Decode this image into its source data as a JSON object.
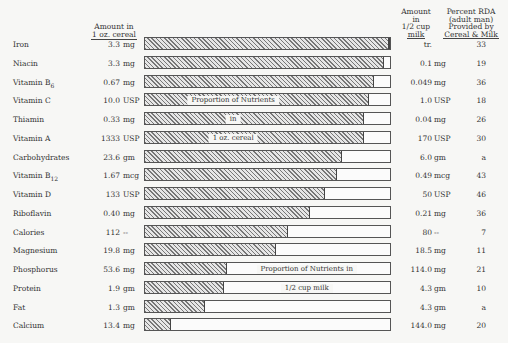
{
  "chart_data": {
    "type": "bar",
    "orientation": "horizontal-stacked-proportion",
    "title": "",
    "columns": {
      "cereal_amount": "Amount in 1 oz. cereal",
      "milk_amount": "Amount in 1/2 cup milk",
      "rda": "Percent RDA (adult man) Provided by Cereal & Milk"
    },
    "bar_annotations": {
      "cereal": [
        "Proportion of Nutrients",
        "in",
        "1 oz. cereal"
      ],
      "milk": [
        "Proportion of Nutrients in",
        "1/2 cup milk"
      ]
    },
    "categories": [
      "Iron",
      "Niacin",
      "Vitamin B6",
      "Vitamin C",
      "Thiamin",
      "Vitamin A",
      "Carbohydrates",
      "Vitamin B12",
      "Vitamin D",
      "Riboflavin",
      "Calories",
      "Magnesium",
      "Phosphorus",
      "Protein",
      "Fat",
      "Calcium"
    ],
    "series": [
      {
        "name": "Proportion from 1 oz. cereal (%)",
        "values": [
          99,
          97,
          93,
          91,
          89,
          89,
          80,
          78,
          73,
          67,
          58,
          53,
          33,
          32,
          24,
          10
        ]
      },
      {
        "name": "Proportion from 1/2 cup milk (%)",
        "values": [
          1,
          3,
          7,
          9,
          11,
          11,
          20,
          22,
          27,
          33,
          42,
          47,
          67,
          68,
          76,
          90
        ]
      }
    ],
    "xlim": [
      0,
      100
    ],
    "legend": "none"
  },
  "headers": {
    "cereal_amount_line1": "Amount in",
    "cereal_amount_line2": "1 oz. cereal",
    "milk_amount_line1": "Amount",
    "milk_amount_line2": "in",
    "milk_amount_line3": "1/2 cup",
    "milk_amount_line4": "milk",
    "rda_line1": "Percent RDA",
    "rda_line2": "(adult man)",
    "rda_line3": "Provided by",
    "rda_line4": "Cereal & Milk"
  },
  "rows": [
    {
      "name": "Iron",
      "sub": "",
      "cereal_amt": "3.3",
      "cereal_unit": "mg",
      "pct": 99,
      "milk_amt": "tr.",
      "milk_unit": "",
      "rda": "33",
      "label": ""
    },
    {
      "name": "Niacin",
      "sub": "",
      "cereal_amt": "3.3",
      "cereal_unit": "mg",
      "pct": 97,
      "milk_amt": "0.1",
      "milk_unit": "mg",
      "rda": "19",
      "label": ""
    },
    {
      "name": "Vitamin B",
      "sub": "6",
      "cereal_amt": "0.67",
      "cereal_unit": "mg",
      "pct": 93,
      "milk_amt": "0.049",
      "milk_unit": "mg",
      "rda": "36",
      "label": ""
    },
    {
      "name": "Vitamin C",
      "sub": "",
      "cereal_amt": "10.0",
      "cereal_unit": "USP",
      "pct": 91,
      "milk_amt": "1.0",
      "milk_unit": "USP",
      "rda": "18",
      "label": "Proportion of Nutrients",
      "label_pos": 36
    },
    {
      "name": "Thiamin",
      "sub": "",
      "cereal_amt": "0.33",
      "cereal_unit": "mg",
      "pct": 89,
      "milk_amt": "0.04",
      "milk_unit": "mg",
      "rda": "26",
      "label": "in",
      "label_pos": 36
    },
    {
      "name": "Vitamin A",
      "sub": "",
      "cereal_amt": "1333",
      "cereal_unit": "USP",
      "pct": 89,
      "milk_amt": "170",
      "milk_unit": "USP",
      "rda": "30",
      "label": "1 oz. cereal",
      "label_pos": 36
    },
    {
      "name": "Carbohydrates",
      "sub": "",
      "cereal_amt": "23.6",
      "cereal_unit": "gm",
      "pct": 80,
      "milk_amt": "6.0",
      "milk_unit": "gm",
      "rda": "a",
      "label": ""
    },
    {
      "name": "Vitamin B",
      "sub": "12",
      "cereal_amt": "1.67",
      "cereal_unit": "mcg",
      "pct": 78,
      "milk_amt": "0.49",
      "milk_unit": "mcg",
      "rda": "43",
      "label": ""
    },
    {
      "name": "Vitamin D",
      "sub": "",
      "cereal_amt": "133",
      "cereal_unit": "USP",
      "pct": 73,
      "milk_amt": "50",
      "milk_unit": "USP",
      "rda": "46",
      "label": ""
    },
    {
      "name": "Riboflavin",
      "sub": "",
      "cereal_amt": "0.40",
      "cereal_unit": "mg",
      "pct": 67,
      "milk_amt": "0.21",
      "milk_unit": "mg",
      "rda": "36",
      "label": ""
    },
    {
      "name": "Calories",
      "sub": "",
      "cereal_amt": "112",
      "cereal_unit": "--",
      "pct": 58,
      "milk_amt": "80",
      "milk_unit": "--",
      "rda": "7",
      "label": ""
    },
    {
      "name": "Magnesium",
      "sub": "",
      "cereal_amt": "19.8",
      "cereal_unit": "mg",
      "pct": 53,
      "milk_amt": "18.5",
      "milk_unit": "mg",
      "rda": "11",
      "label": ""
    },
    {
      "name": "Phosphorus",
      "sub": "",
      "cereal_amt": "53.6",
      "cereal_unit": "mg",
      "pct": 33,
      "milk_amt": "114.0",
      "milk_unit": "mg",
      "rda": "21",
      "label": "Proportion of Nutrients in",
      "label_pos": 66
    },
    {
      "name": "Protein",
      "sub": "",
      "cereal_amt": "1.9",
      "cereal_unit": "gm",
      "pct": 32,
      "milk_amt": "4.3",
      "milk_unit": "gm",
      "rda": "10",
      "label": "1/2 cup milk",
      "label_pos": 66
    },
    {
      "name": "Fat",
      "sub": "",
      "cereal_amt": "1.3",
      "cereal_unit": "gm",
      "pct": 24,
      "milk_amt": "4.3",
      "milk_unit": "gm",
      "rda": "a",
      "label": ""
    },
    {
      "name": "Calcium",
      "sub": "",
      "cereal_amt": "13.4",
      "cereal_unit": "mg",
      "pct": 10,
      "milk_amt": "144.0",
      "milk_unit": "mg",
      "rda": "20",
      "label": ""
    }
  ]
}
